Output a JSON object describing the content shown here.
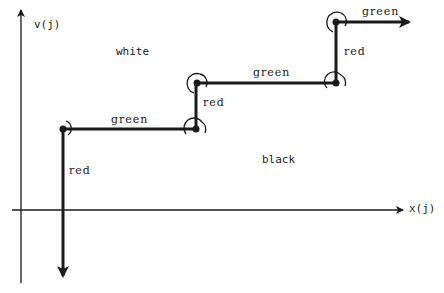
{
  "axes": {
    "y_label": "v(j)",
    "x_label": "x(j)"
  },
  "regions": {
    "upper": "white",
    "lower": "black"
  },
  "path": {
    "segments": [
      {
        "direction": "down",
        "label": "red"
      },
      {
        "direction": "right",
        "label": "green"
      },
      {
        "direction": "up",
        "label": "red"
      },
      {
        "direction": "right",
        "label": "green"
      },
      {
        "direction": "up",
        "label": "red"
      },
      {
        "direction": "right",
        "label": "green"
      }
    ]
  },
  "colors": {
    "line": "#1a1a1a",
    "text": "#222222",
    "background": "#ffffff"
  }
}
